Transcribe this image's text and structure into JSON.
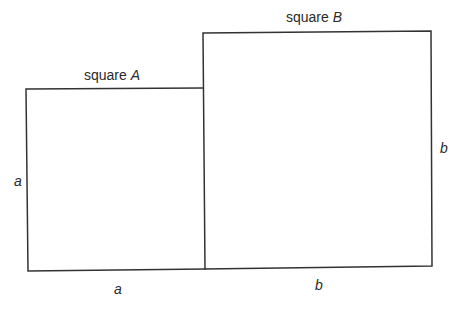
{
  "diagram": {
    "square_a": {
      "title_prefix": "square ",
      "title_var": "A",
      "side_label_left": "a",
      "side_label_bottom": "a"
    },
    "square_b": {
      "title_prefix": "square ",
      "title_var": "B",
      "side_label_right": "b",
      "side_label_bottom": "b"
    },
    "colors": {
      "stroke": "#333333",
      "text": "#2a2a2a",
      "background": "#ffffff"
    }
  }
}
